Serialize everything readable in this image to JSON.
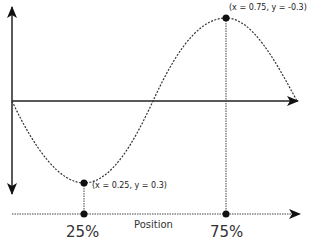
{
  "diagram": {
    "type": "sine-wave-position-diagram",
    "colors": {
      "line": "#222222",
      "curve": "#333333",
      "background": "#ffffff"
    },
    "points": {
      "min": {
        "label": "(x = 0.25, y = 0.3)",
        "x_value": 0.25,
        "y_value": 0.3
      },
      "max": {
        "label": "(x = 0.75, y = -0.3)",
        "x_value": 0.75,
        "y_value": -0.3
      }
    },
    "bottom_axis": {
      "label": "Position",
      "ticks": [
        {
          "label": "25%"
        },
        {
          "label": "75%"
        }
      ]
    }
  }
}
